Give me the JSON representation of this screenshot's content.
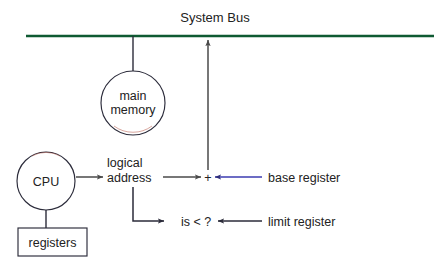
{
  "figure": {
    "type": "diagram",
    "background_color": "#ffffff"
  },
  "colors": {
    "bus_line": "#0f5a32",
    "base_register_line": "#3b3bb0",
    "default_line": "#2b2b3a",
    "cpu_arrow_line": "#4a4a4a",
    "node_stroke": "#2b2b3a",
    "node_fill": "#ffffff",
    "text": "#222222"
  },
  "labels": {
    "system_bus": "System Bus",
    "main_memory_line1": "main",
    "main_memory_line2": "memory",
    "cpu": "CPU",
    "registers": "registers",
    "logical_line1": "logical",
    "logical_line2": "address",
    "plus": "+",
    "compare": "is < ?",
    "base_register": "base register",
    "limit_register": "limit register"
  },
  "nodes": [
    {
      "name": "system-bus",
      "label": "System Bus",
      "shape": "line",
      "x1": 26,
      "y1": 36,
      "x2": 434,
      "y2": 36
    },
    {
      "name": "main-memory",
      "label": "main memory",
      "shape": "circle",
      "cx": 133,
      "cy": 103,
      "r": 32
    },
    {
      "name": "cpu",
      "label": "CPU",
      "shape": "circle",
      "cx": 46,
      "cy": 181,
      "r": 29
    },
    {
      "name": "registers",
      "label": "registers",
      "shape": "rect",
      "x": 18,
      "y": 228,
      "width": 69,
      "height": 28
    },
    {
      "name": "logical-address",
      "label": "logical address",
      "shape": "text",
      "x": 133,
      "y": 170
    },
    {
      "name": "adder",
      "label": "+",
      "shape": "text",
      "x": 208,
      "y": 177
    },
    {
      "name": "comparator",
      "label": "is < ?",
      "shape": "text",
      "x": 196,
      "y": 221
    },
    {
      "name": "base-register",
      "label": "base register",
      "shape": "text",
      "x": 268,
      "y": 177
    },
    {
      "name": "limit-register",
      "label": "limit register",
      "shape": "text",
      "x": 268,
      "y": 221
    }
  ],
  "edges": [
    {
      "name": "memory-to-bus",
      "from": "main-memory",
      "to": "system-bus",
      "style": "plain",
      "color": "#2b2b3a"
    },
    {
      "name": "adder-to-bus",
      "from": "adder",
      "to": "system-bus",
      "style": "arrow",
      "color": "#4a4a4a"
    },
    {
      "name": "cpu-to-registers",
      "from": "cpu",
      "to": "registers",
      "style": "plain",
      "color": "#2b2b3a"
    },
    {
      "name": "cpu-to-logical-address",
      "from": "cpu",
      "to": "logical-address",
      "style": "arrow",
      "color": "#4a4a4a"
    },
    {
      "name": "logical-address-to-adder",
      "from": "logical-address",
      "to": "adder",
      "style": "arrow",
      "color": "#4a4a4a"
    },
    {
      "name": "logical-address-to-comparator",
      "from": "logical-address",
      "to": "comparator",
      "style": "elbow-arrow",
      "color": "#2b2b3a"
    },
    {
      "name": "base-register-to-adder",
      "from": "base-register",
      "to": "adder",
      "style": "arrow",
      "color": "#3b3bb0"
    },
    {
      "name": "limit-register-to-comparator",
      "from": "limit-register",
      "to": "comparator",
      "style": "arrow",
      "color": "#2b2b3a"
    }
  ]
}
